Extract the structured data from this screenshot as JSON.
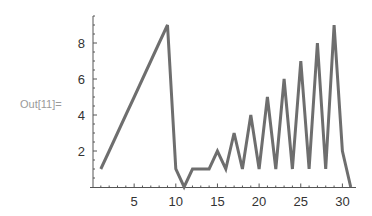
{
  "cell": {
    "out_label": "Out[11]="
  },
  "chart_data": {
    "type": "line",
    "title": "",
    "xlabel": "",
    "ylabel": "",
    "x": [
      1,
      2,
      3,
      4,
      5,
      6,
      7,
      8,
      9,
      10,
      11,
      12,
      13,
      14,
      15,
      16,
      17,
      18,
      19,
      20,
      21,
      22,
      23,
      24,
      25,
      26,
      27,
      28,
      29,
      30,
      31
    ],
    "values": [
      1,
      2,
      3,
      4,
      5,
      6,
      7,
      8,
      9,
      1,
      0,
      1,
      1,
      1,
      2,
      1,
      3,
      1,
      4,
      1,
      5,
      1,
      6,
      1,
      7,
      1,
      8,
      1,
      9,
      2,
      0
    ],
    "xlim": [
      0,
      31.5
    ],
    "ylim": [
      0,
      9.5
    ],
    "x_ticks": [
      5,
      10,
      15,
      20,
      25,
      30
    ],
    "y_ticks": [
      2,
      4,
      6,
      8
    ],
    "grid": false,
    "legend": null,
    "line_color": "#6e6e6e"
  }
}
